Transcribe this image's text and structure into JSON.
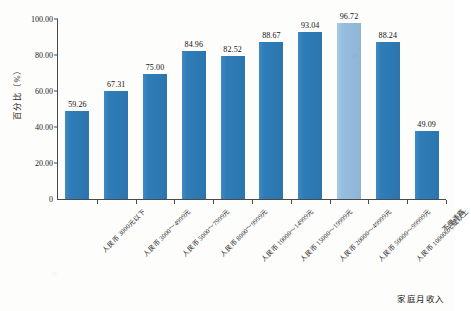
{
  "chart_data": {
    "type": "bar",
    "title": "",
    "xlabel": "家庭月收入",
    "ylabel": "百分比（%）",
    "ylim": [
      0,
      100
    ],
    "yticks": [
      "0",
      "20.00",
      "40.00",
      "60.00",
      "80.00",
      "100.00"
    ],
    "ytick_values": [
      0,
      20,
      40,
      60,
      80,
      100
    ],
    "grid": false,
    "legend": "none",
    "categories": [
      "人民币 3000元以下",
      "人民币 3000～4999元",
      "人民币 5000～7999元",
      "人民币 8000～9999元",
      "人民币 10000～14999元",
      "人民币 15000～19999元",
      "人民币 20000～49999元",
      "人民币 50000～99999元",
      "人民币 100000元或以上",
      "不便透露"
    ],
    "values": [
      59.26,
      67.31,
      75.0,
      84.96,
      82.52,
      88.67,
      93.04,
      96.72,
      88.24,
      49.09
    ],
    "value_labels": [
      "59.26",
      "67.31",
      "75.00",
      "84.96",
      "82.52",
      "88.67",
      "93.04",
      "96.72",
      "88.24",
      "49.09"
    ],
    "bar_heights_plotted": [
      49.1,
      59.8,
      69.6,
      82.4,
      79.5,
      87.3,
      92.9,
      97.6,
      87.0,
      38.0
    ],
    "highlight_index": 7,
    "colors": {
      "bar": "#2e7cb8",
      "bar_highlight": "#95bdde",
      "axis": "#4a4a4a",
      "text": "#1a1a1a",
      "background": "#fdfdfc"
    }
  }
}
